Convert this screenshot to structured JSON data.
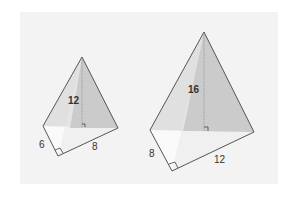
{
  "diagram": {
    "title": "",
    "colors": {
      "background_panel": "#f3f3f3",
      "face_light": "#e2e2e2",
      "face_dark": "#c9c9c9",
      "base_fill": "#f6f6f6",
      "edge": "#555555",
      "text": "#333333"
    },
    "pyramids": [
      {
        "id": "small",
        "height_label": "12",
        "base_leg1_label": "6",
        "base_leg2_label": "8"
      },
      {
        "id": "large",
        "height_label": "16",
        "base_leg1_label": "8",
        "base_leg2_label": "12"
      }
    ]
  }
}
